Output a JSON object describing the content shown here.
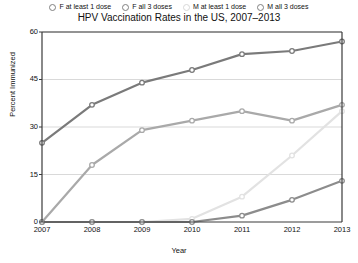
{
  "chart_data": {
    "type": "line",
    "title": "HPV Vaccination Rates in the US, 2007–2013",
    "xlabel": "Year",
    "ylabel": "Percent Immunized",
    "categories": [
      "2007",
      "2008",
      "2009",
      "2010",
      "2011",
      "2012",
      "2013"
    ],
    "x": [
      2007,
      2008,
      2009,
      2010,
      2011,
      2012,
      2013
    ],
    "xlim": [
      2007,
      2013
    ],
    "ylim": [
      0,
      60
    ],
    "yticks": [
      0,
      15,
      30,
      45,
      60
    ],
    "grid": true,
    "legend_position": "top",
    "series": [
      {
        "name": "F at least 1 dose",
        "color": "#7a7a7a",
        "values": [
          25,
          37,
          44,
          48,
          53,
          54,
          57
        ]
      },
      {
        "name": "F all 3 doses",
        "color": "#a9a9a9",
        "values": [
          0,
          18,
          29,
          32,
          35,
          32,
          37
        ]
      },
      {
        "name": "M at least 1 dose",
        "color": "#e2e2e2",
        "values": [
          0,
          0,
          0,
          1,
          8,
          21,
          35
        ]
      },
      {
        "name": "M all 3 doses",
        "color": "#8c8c8c",
        "values": [
          0,
          0,
          0,
          0,
          2,
          7,
          13
        ]
      }
    ]
  },
  "legend": {
    "items": [
      {
        "label": "F at least 1 dose"
      },
      {
        "label": "F all 3 doses"
      },
      {
        "label": "M at least 1 dose"
      },
      {
        "label": "M all 3 doses"
      }
    ]
  },
  "axes": {
    "yticks": [
      "60",
      "45",
      "30",
      "15",
      "0"
    ],
    "xticks": [
      "2007",
      "2008",
      "2009",
      "2010",
      "2011",
      "2012",
      "2013"
    ]
  }
}
